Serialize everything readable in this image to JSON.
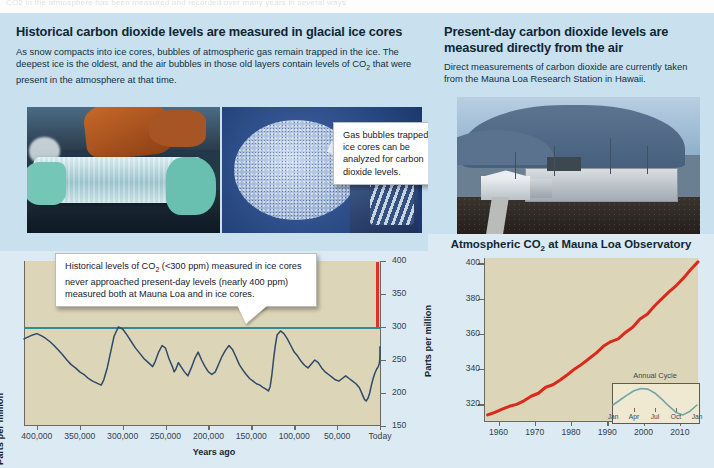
{
  "scan_bleed": "CO2 in the atmosphere has been measured and recorded over many years in several ways",
  "left_panel": {
    "heading": "Historical carbon dioxide levels are measured in glacial ice cores",
    "body": "As snow compacts into ice cores, bubbles of atmospheric gas remain trapped in the ice. The deepest ice is the oldest, and the air bubbles in those old layers contain levels of CO2 that were present in the atmosphere at that time.",
    "photo_icecore_name": "ice-core-held-in-gloved-hands",
    "photo_bubbles_name": "ice-core-bubble-microscopy",
    "callout_bubbles": "Gas bubbles trapped in ice cores can be analyzed for carbon dioxide levels."
  },
  "right_panel": {
    "heading": "Present-day carbon dioxide levels are measured directly from the air",
    "body": "Direct measurements of carbon dioxide are currently taken from the Mauna Loa Research Station in Hawaii.",
    "photo_observatory_name": "mauna-loa-research-station"
  },
  "callouts": {
    "icecore": "Historical levels of CO2 (<300 ppm) measured in ice cores never approached present-day levels (nearly 400 ppm) measured both at Mauna Loa and in ice cores.",
    "maunaloa": "Measurements show a rapid, long-term climb. The seasonal fluctuations are due to higher levels of photosynthesis in the summer."
  },
  "colors": {
    "panel_blue": "#c9e0ef",
    "chart_panel_blue": "#dceaf4",
    "plot_tan": "#ddd5b8",
    "inset_tan": "#f0e9d2",
    "icecore_line": "#2d4a6b",
    "reference_line_300": "#2f8c95",
    "present_day_spike": "#e03126",
    "maunaloa_line": "#d92a1c",
    "annual_cycle_line": "#6fa6a8",
    "heading_text": "#102733"
  },
  "chart_data": [
    {
      "id": "ice-core-chart",
      "type": "line",
      "title": "",
      "xlabel": "Years ago",
      "ylabel": "Parts per million",
      "xticks": [
        "400,000",
        "350,000",
        "300,000",
        "250,000",
        "200,000",
        "150,000",
        "100,000",
        "50,000",
        "Today"
      ],
      "xtick_values": [
        400000,
        350000,
        300000,
        250000,
        200000,
        150000,
        100000,
        50000,
        0
      ],
      "yticks": [
        150,
        200,
        250,
        300,
        350,
        400
      ],
      "ylim": [
        150,
        400
      ],
      "xlim": [
        415000,
        0
      ],
      "grid": false,
      "legend": "none",
      "reference_line": {
        "label": "300 ppm",
        "value": 300,
        "color": "#2f8c95"
      },
      "annotations": [
        {
          "label": "present-day spike",
          "x": 0,
          "y_from": 300,
          "y_to": 398,
          "color": "#e03126"
        }
      ],
      "series": [
        {
          "name": "Ice core CO2 (ppm)",
          "color": "#2d4a6b",
          "x": [
            415000,
            410000,
            405000,
            400000,
            395000,
            390000,
            385000,
            380000,
            375000,
            370000,
            365000,
            360000,
            355000,
            350000,
            345000,
            340000,
            335000,
            330000,
            325000,
            322000,
            318000,
            314000,
            310000,
            305000,
            300000,
            295000,
            290000,
            285000,
            280000,
            275000,
            270000,
            265000,
            262000,
            258000,
            254000,
            250000,
            246000,
            242000,
            240000,
            238000,
            235000,
            232000,
            228000,
            224000,
            220000,
            216000,
            212000,
            208000,
            204000,
            200000,
            196000,
            192000,
            188000,
            184000,
            180000,
            176000,
            172000,
            168000,
            164000,
            160000,
            156000,
            152000,
            148000,
            144000,
            140000,
            136000,
            132000,
            130000,
            128000,
            126000,
            124000,
            122000,
            120000,
            116000,
            112000,
            108000,
            104000,
            100000,
            96000,
            92000,
            88000,
            84000,
            80000,
            76000,
            72000,
            68000,
            64000,
            60000,
            56000,
            52000,
            48000,
            44000,
            40000,
            36000,
            32000,
            28000,
            24000,
            20000,
            18000,
            16000,
            14000,
            12000,
            10000,
            8000,
            6000,
            4000,
            2000,
            1000,
            500,
            200,
            100,
            0
          ],
          "y": [
            282,
            285,
            288,
            290,
            287,
            283,
            278,
            272,
            265,
            258,
            250,
            243,
            238,
            232,
            228,
            222,
            218,
            215,
            212,
            220,
            238,
            262,
            286,
            300,
            297,
            288,
            278,
            268,
            260,
            252,
            246,
            240,
            248,
            262,
            272,
            268,
            252,
            240,
            232,
            236,
            246,
            240,
            232,
            226,
            238,
            252,
            262,
            250,
            240,
            232,
            228,
            232,
            244,
            256,
            265,
            272,
            266,
            255,
            243,
            235,
            228,
            222,
            218,
            214,
            212,
            208,
            205,
            203,
            210,
            228,
            252,
            272,
            288,
            294,
            290,
            282,
            272,
            262,
            256,
            248,
            242,
            238,
            244,
            250,
            246,
            238,
            232,
            228,
            224,
            220,
            218,
            222,
            226,
            222,
            218,
            214,
            208,
            196,
            190,
            188,
            192,
            200,
            212,
            222,
            230,
            236,
            240,
            244,
            248,
            252,
            258,
            270,
            280,
            290,
            296,
            300
          ]
        }
      ]
    },
    {
      "id": "mauna-loa-chart",
      "type": "line",
      "title": "Atmospheric CO2 at Mauna Loa Observatory",
      "xlabel": "",
      "ylabel": "Parts per million",
      "xticks": [
        "1960",
        "1970",
        "1980",
        "1990",
        "2000",
        "2010"
      ],
      "xtick_values": [
        1960,
        1970,
        1980,
        1990,
        2000,
        2010
      ],
      "yticks": [
        320,
        340,
        360,
        380,
        400
      ],
      "ylim": [
        310,
        403
      ],
      "xlim": [
        1956,
        2015
      ],
      "grid": false,
      "legend": "none",
      "series": [
        {
          "name": "Monthly mean CO2 (ppm)",
          "color": "#d92a1c",
          "x": [
            1957,
            1959,
            1961,
            1963,
            1965,
            1967,
            1969,
            1971,
            1973,
            1975,
            1977,
            1979,
            1981,
            1983,
            1985,
            1987,
            1989,
            1991,
            1993,
            1995,
            1997,
            1999,
            2001,
            2003,
            2005,
            2007,
            2009,
            2011,
            2013,
            2015
          ],
          "y": [
            314,
            315.5,
            317.3,
            318.9,
            320.0,
            322.0,
            324.6,
            326.3,
            329.7,
            331.1,
            333.8,
            336.8,
            340.1,
            342.8,
            346.0,
            349.2,
            353.1,
            355.6,
            357.1,
            360.8,
            363.7,
            368.4,
            371.1,
            375.8,
            379.8,
            383.8,
            387.4,
            391.6,
            396.5,
            400.8
          ]
        }
      ],
      "inset": {
        "title": "Annual Cycle",
        "type": "line",
        "xticks": [
          "Jan",
          "Apr",
          "Jul",
          "Oct",
          "Jan"
        ],
        "ylabel": "",
        "color": "#6fa6a8",
        "x": [
          0,
          1,
          2,
          3,
          4,
          5,
          6,
          7,
          8,
          9,
          10,
          11,
          12
        ],
        "y": [
          0.42,
          0.58,
          0.74,
          0.88,
          0.95,
          0.93,
          0.8,
          0.6,
          0.38,
          0.18,
          0.1,
          0.22,
          0.42
        ],
        "note": "peak in May, minimum in October"
      }
    }
  ]
}
